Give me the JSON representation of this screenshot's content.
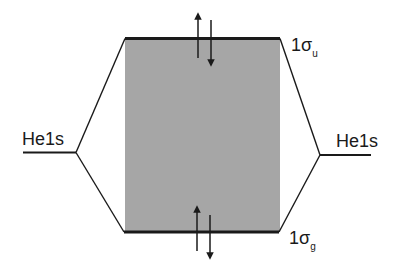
{
  "diagram": {
    "type": "molecular-orbital-energy-diagram",
    "colors": {
      "line": "#1a1a1a",
      "shade": "#a6a6a6",
      "background": "#ffffff"
    },
    "atomic_orbitals": {
      "left": {
        "label": "He1s"
      },
      "right": {
        "label": "He1s"
      }
    },
    "molecular_orbitals": [
      {
        "id": "antibonding",
        "label_main": "1σ",
        "label_sub": "u",
        "electrons": 2,
        "spins": [
          "up",
          "down"
        ]
      },
      {
        "id": "bonding",
        "label_main": "1σ",
        "label_sub": "g",
        "electrons": 2,
        "spins": [
          "up",
          "down"
        ]
      }
    ]
  }
}
